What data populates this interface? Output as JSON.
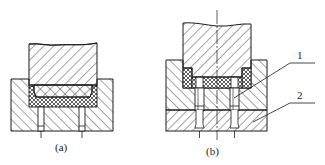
{
  "figure": {
    "panels": [
      {
        "id": "a",
        "caption": "(a)",
        "parts": [
          "punch",
          "die-block",
          "rubber-pad",
          "bolt-left",
          "bolt-right"
        ]
      },
      {
        "id": "b",
        "caption": "(b)",
        "parts": [
          "punch",
          "upper-die-block",
          "lower-plate",
          "rubber-pad",
          "bolt-left",
          "bolt-right",
          "centerline"
        ],
        "callouts": [
          {
            "label": "1"
          },
          {
            "label": "2"
          }
        ]
      }
    ]
  },
  "colors": {
    "line": "#1a1a1a",
    "background": "#ffffff"
  }
}
